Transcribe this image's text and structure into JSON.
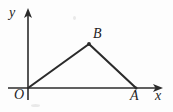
{
  "figure": {
    "type": "coordinate-plane-diagram",
    "background_color": "#fdfdfd",
    "ink_color": "#2b2b2b",
    "axes": {
      "x_axis": {
        "label": "x",
        "from": [
          8,
          88
        ],
        "to": [
          163,
          88
        ],
        "arrow": "right"
      },
      "y_axis": {
        "label": "y",
        "from": [
          28,
          100
        ],
        "to": [
          28,
          8
        ],
        "arrow": "up"
      },
      "origin_label": "O",
      "origin_point": [
        28,
        88
      ]
    },
    "points": [
      {
        "label": "O",
        "x": 28,
        "y": 88,
        "label_dx": -14,
        "label_dy": 2
      },
      {
        "label": "B",
        "x": 89,
        "y": 44,
        "label_dx": 4,
        "label_dy": -17
      },
      {
        "label": "A",
        "x": 136,
        "y": 88,
        "label_dx": -6,
        "label_dy": 2
      }
    ],
    "segments": [
      {
        "name": "OB",
        "from": "O",
        "to": "B"
      },
      {
        "name": "BA",
        "from": "B",
        "to": "A"
      }
    ],
    "labels": {
      "x": "x",
      "y": "y",
      "O": "O",
      "A": "A",
      "B": "B"
    }
  }
}
